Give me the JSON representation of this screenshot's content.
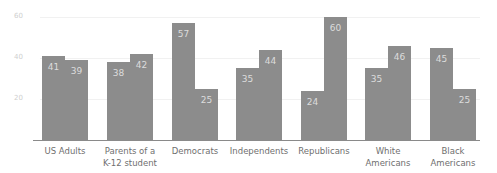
{
  "chart_data": {
    "type": "bar",
    "title": "",
    "xlabel": "",
    "ylabel": "",
    "ylim": [
      0,
      60
    ],
    "yticks": [
      "20",
      "40",
      "60"
    ],
    "grid": true,
    "legend": null,
    "categories": [
      "US Adults",
      "Parents of a K-12 student",
      "Democrats",
      "Independents",
      "Republicans",
      "White Americans",
      "Black Americans"
    ],
    "series": [
      {
        "name": "Series 1",
        "values": [
          41,
          38,
          57,
          35,
          24,
          35,
          45
        ]
      },
      {
        "name": "Series 2",
        "values": [
          39,
          42,
          25,
          44,
          60,
          46,
          25
        ]
      }
    ]
  },
  "labels": {
    "cat0": "US Adults",
    "cat1_l1": "Parents of a",
    "cat1_l2": "K-12 student",
    "cat2": "Democrats",
    "cat3": "Independents",
    "cat4": "Republicans",
    "cat5_l1": "White",
    "cat5_l2": "Americans",
    "cat6_l1": "Black",
    "cat6_l2": "Americans"
  },
  "colors": {
    "bar": "#8c8c8c",
    "value_text": "#dcdcdc",
    "axis_text": "#6f6f6f"
  }
}
